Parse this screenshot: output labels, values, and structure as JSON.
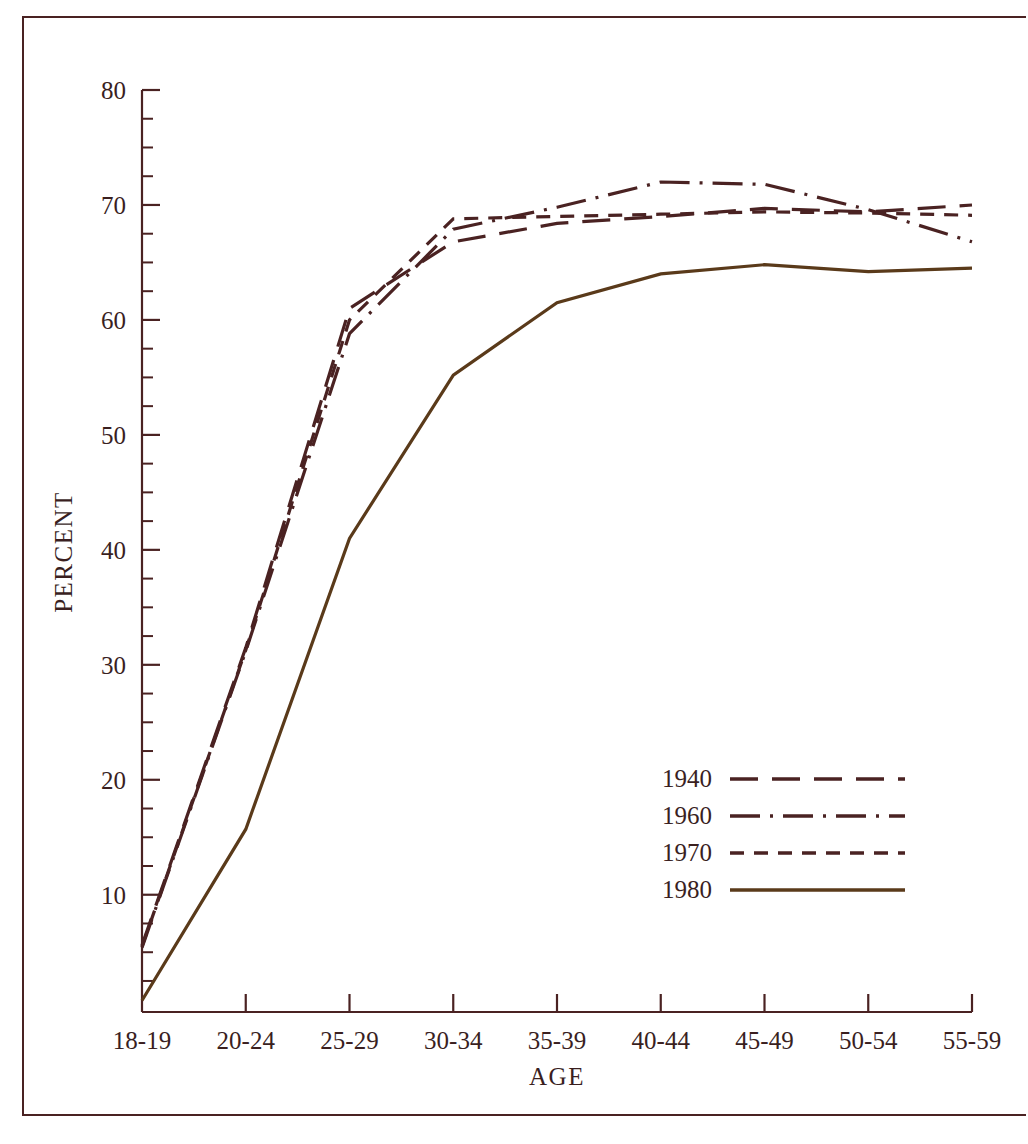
{
  "figure": {
    "background_color": "#ffffff",
    "ink_color": "#4a2222",
    "line_color_1980": "#5a3a1a"
  },
  "axes": {
    "x_title": "AGE",
    "y_title": "PERCENT",
    "y_ticks": [
      "10",
      "20",
      "30",
      "40",
      "50",
      "60",
      "70",
      "80"
    ],
    "y_min": 0,
    "y_max": 80,
    "x_categories": [
      "18-19",
      "20-24",
      "25-29",
      "30-34",
      "35-39",
      "40-44",
      "45-49",
      "50-54",
      "55-59"
    ]
  },
  "legend": {
    "entries": [
      {
        "label": "1940",
        "dash": "28,14",
        "color": "#4a2222"
      },
      {
        "label": "1960",
        "dash": "30,10,3,10",
        "color": "#4a2222"
      },
      {
        "label": "1970",
        "dash": "14,10",
        "color": "#4a2222"
      },
      {
        "label": "1980",
        "dash": "none",
        "color": "#5a3a1a"
      }
    ]
  },
  "chart_data": {
    "type": "line",
    "title": "",
    "xlabel": "AGE",
    "ylabel": "PERCENT",
    "ylim": [
      0,
      80
    ],
    "grid": false,
    "legend_position": "inside-lower-right",
    "categories": [
      "18-19",
      "20-24",
      "25-29",
      "30-34",
      "35-39",
      "40-44",
      "45-49",
      "50-54",
      "55-59"
    ],
    "series": [
      {
        "name": "1940",
        "style": "long-dash",
        "values": [
          5.6,
          31.5,
          61.0,
          66.8,
          68.4,
          69.0,
          69.7,
          69.4,
          70.0
        ]
      },
      {
        "name": "1960",
        "style": "dash-dot",
        "values": [
          5.4,
          31.2,
          58.8,
          67.9,
          69.8,
          72.0,
          71.8,
          69.6,
          66.8
        ]
      },
      {
        "name": "1970",
        "style": "short-dash",
        "values": [
          5.5,
          31.3,
          60.0,
          68.8,
          69.0,
          69.2,
          69.4,
          69.3,
          69.1
        ]
      },
      {
        "name": "1980",
        "style": "solid",
        "values": [
          0.8,
          15.7,
          41.0,
          55.2,
          61.5,
          64.0,
          64.8,
          64.2,
          64.5
        ]
      }
    ]
  }
}
